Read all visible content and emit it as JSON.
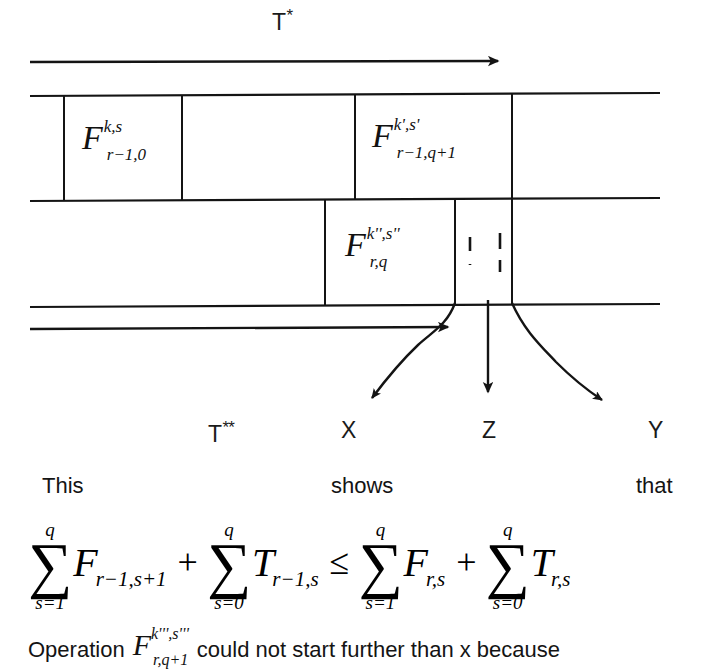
{
  "figure": {
    "title_arrow_label": {
      "text": "T",
      "marks": "*"
    },
    "timeline_labels": [
      {
        "name": "t-double-star",
        "text": "T",
        "marks": "**"
      },
      {
        "name": "x",
        "text": "X",
        "marks": ""
      },
      {
        "name": "z",
        "text": "Z",
        "marks": ""
      },
      {
        "name": "y",
        "text": "Y",
        "marks": ""
      }
    ],
    "operations": [
      {
        "id": "op-f-r-minus-1-0",
        "base": "F",
        "superscript": "k,s",
        "subscript": "r−1,0"
      },
      {
        "id": "op-f-r-minus-1-q-plus-1",
        "base": "F",
        "superscript": "k',s'",
        "subscript": "r−1,q+1"
      },
      {
        "id": "op-f-r-q",
        "base": "F",
        "superscript": "k'',s''",
        "subscript": "r,q"
      }
    ],
    "colors": {
      "ink": "#111111",
      "line": "#1a1a1a",
      "background": "#ffffff"
    }
  },
  "caption": {
    "words": [
      {
        "name": "word-this",
        "text": "This"
      },
      {
        "name": "word-shows",
        "text": "shows"
      },
      {
        "name": "word-that",
        "text": "that"
      }
    ]
  },
  "formula": {
    "terms": [
      {
        "name": "sum-f-r-minus-1-s-plus-1",
        "sigma": "∑",
        "upper": "q",
        "lower": "s=1",
        "var": "F",
        "sub": "r−1,s+1"
      },
      {
        "name": "sum-t-r-minus-1-s",
        "sigma": "∑",
        "upper": "q",
        "lower": "s=0",
        "var": "T",
        "sub": "r−1,s"
      },
      {
        "name": "sum-f-r-s",
        "sigma": "∑",
        "upper": "q",
        "lower": "s=1",
        "var": "F",
        "sub": "r,s"
      },
      {
        "name": "sum-t-r-s",
        "sigma": "∑",
        "upper": "q",
        "lower": "s=0",
        "var": "T",
        "sub": "r,s"
      }
    ],
    "operators": {
      "plus": "+",
      "leq": "≤"
    }
  },
  "footnote": {
    "lead": "Operation",
    "operation": {
      "base": "F",
      "superscript": "k''',s'''",
      "subscript": "r,q+1"
    },
    "tail": "could not start further than x because"
  }
}
